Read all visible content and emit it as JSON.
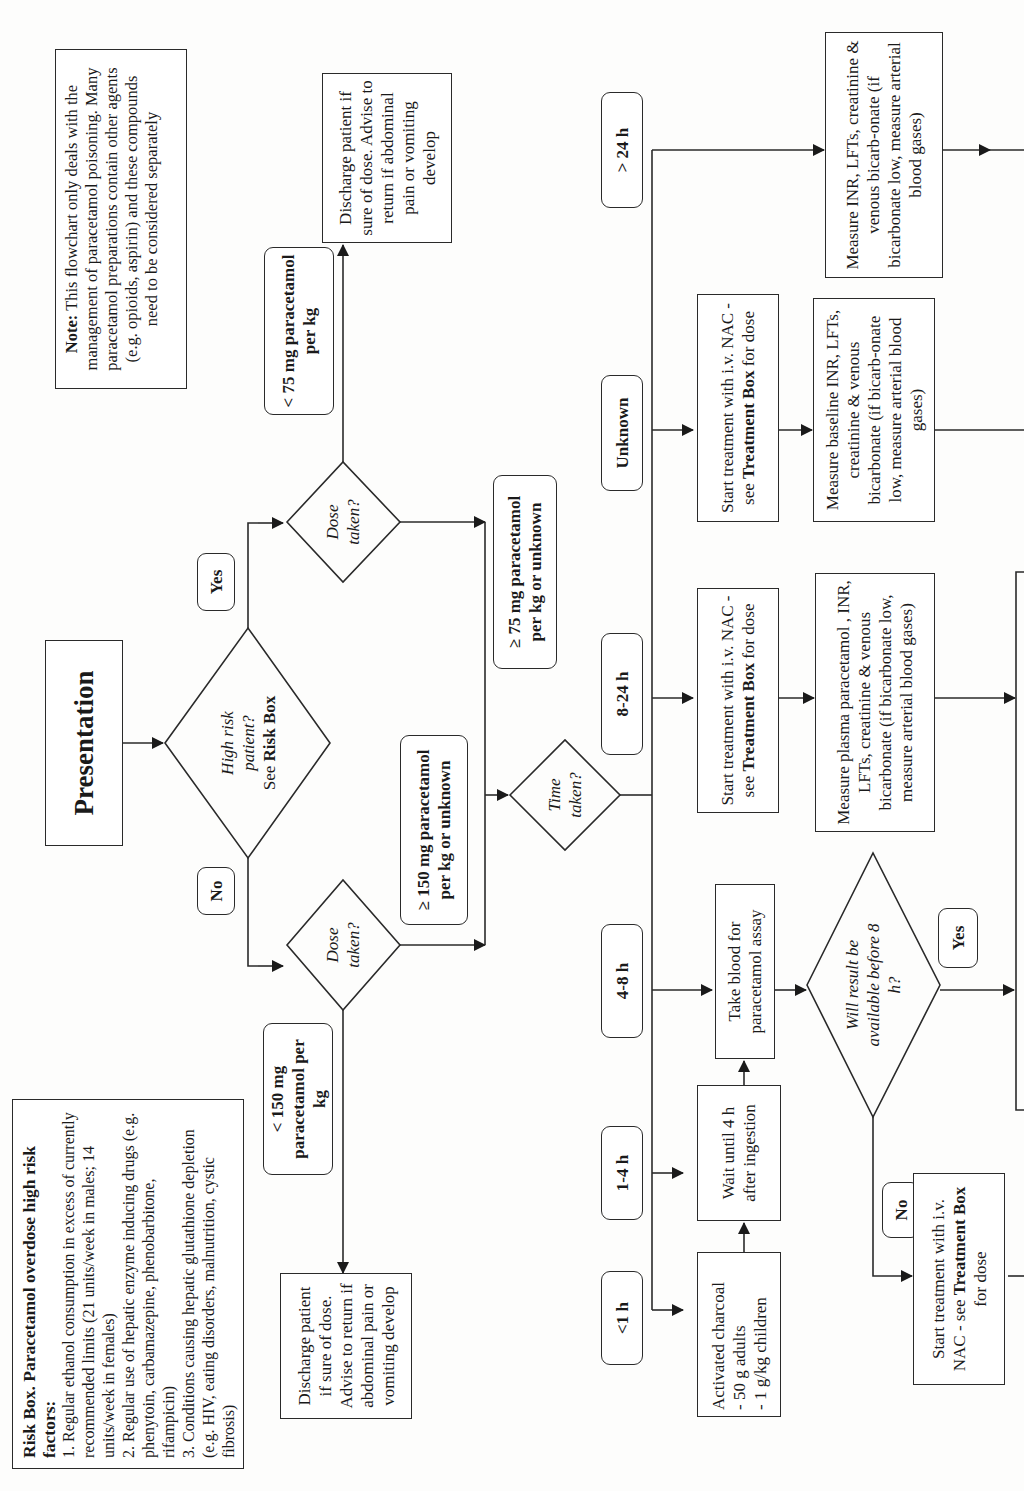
{
  "risk_box": {
    "title": "Risk Box. Paracetamol overdose high risk factors:",
    "items": [
      "1. Regular ethanol consumption in excess of currently recommended limits (21 units/week in males; 14 units/week in females)",
      "2. Regular use of hepatic enzyme inducing drugs (e.g. phenytoin, carbamazepine, phenobarbitone, rifampicin)",
      "3. Conditions causing hepatic glutathione depletion (e.g. HIV, eating disorders, malnutrition, cystic fibrosis)"
    ]
  },
  "note": {
    "label": "Note:",
    "text": "This flowchart only deals with the management of paracetamol poisoning. Many paracetamol preparations contain other agents (e.g. opioids, aspirin) and these compounds need to be considered separately"
  },
  "nodes": {
    "presentation": "Presentation",
    "high_risk": {
      "q1": "High risk",
      "q2": "patient?",
      "see": "See ",
      "bold": "Risk Box"
    },
    "dose_taken_no": "Dose taken?",
    "dose_taken_yes": "Dose taken?",
    "time_taken": "Time taken?",
    "discharge_low": "Discharge patient if sure of dose. Advise to return if abdominal pain or vomiting develop",
    "discharge_high": "Discharge patient if sure of dose. Advise to return if abdominal pain or vomiting develop",
    "charcoal": {
      "line1": "Activated charcoal",
      "line2": "- 50 g adults",
      "line3": "- 1 g/kg children"
    },
    "wait": "Wait until 4 h after ingestion",
    "take_blood": "Take blood for paracetamol assay",
    "will_result": "Will result be available before 8 h?",
    "start_nac_no": {
      "pre": "Start treatment with i.v. NAC - see ",
      "bold": "Treatment Box",
      "post": " for dose"
    },
    "start_nac_824": {
      "pre": "Start treatment with i.v. NAC - see ",
      "bold": "Treatment Box",
      "post": " for dose"
    },
    "start_nac_unknown": {
      "pre": "Start treatment with i.v. NAC - see ",
      "bold": "Treatment Box",
      "post": " for dose"
    },
    "measure_824": "Measure plasma paracetamol , INR, LFTs, creatinine & venous bicarbonate (if bicarbonate low, measure arterial blood gases)",
    "measure_unknown": "Measure baseline INR, LFTs, creatinine & venous bicarbonate (if bicarb-onate low, measure arterial blood gases)",
    "measure_24": "Measure INR, LFTs, creatinine & venous bicarb-onate (if bicarbonate low, measure arterial blood gases)"
  },
  "labels": {
    "no": "No",
    "yes": "Yes",
    "lt150": "< 150 mg paracetamol per kg",
    "ge150": "≥ 150 mg paracetamol per kg or unknown",
    "lt75": "< 75 mg paracetamol per kg",
    "ge75": "≥ 75 mg paracetamol per kg or unknown",
    "t_lt1": "<1 h",
    "t_1_4": "1-4 h",
    "t_4_8": "4-8 h",
    "t_8_24": "8-24 h",
    "t_unknown": "Unknown",
    "t_gt24": "> 24 h",
    "result_yes": "Yes",
    "result_no": "No"
  }
}
